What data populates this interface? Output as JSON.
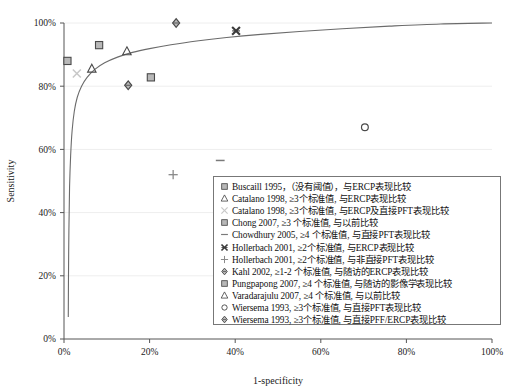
{
  "chart_data": {
    "type": "scatter",
    "title": "",
    "xlabel": "1-specificity",
    "ylabel": "Sensitivity",
    "xlim": [
      0,
      100
    ],
    "ylim": [
      0,
      100
    ],
    "xticks": [
      "0%",
      "20%",
      "40%",
      "60%",
      "80%",
      "100%"
    ],
    "xtick_values": [
      0,
      20,
      40,
      60,
      80,
      100
    ],
    "yticks": [
      "0%",
      "20%",
      "40%",
      "60%",
      "80%",
      "100%"
    ],
    "ytick_values": [
      0,
      20,
      40,
      60,
      80,
      100
    ],
    "grid": false,
    "legend_position": "inside-bottom-right",
    "points": [
      {
        "label": "Buscaill 1995",
        "marker": "square",
        "x": 0.8,
        "y": 88.0
      },
      {
        "label": "Catalano 1998 (x)",
        "marker": "x-light",
        "x": 3.0,
        "y": 84.0
      },
      {
        "label": "Catalano 1998 (triangle)",
        "marker": "triangle",
        "x": 6.5,
        "y": 85.5
      },
      {
        "label": "Chong 2007",
        "marker": "square",
        "x": 8.2,
        "y": 93.0
      },
      {
        "label": "Varadarajulu 2007",
        "marker": "triangle",
        "x": 14.7,
        "y": 91.0
      },
      {
        "label": "Kahl 2002",
        "marker": "diamond",
        "x": 15.0,
        "y": 80.3
      },
      {
        "label": "Pungpapong 2007",
        "marker": "square",
        "x": 20.3,
        "y": 82.8
      },
      {
        "label": "Wiersema 1993 (PFF/ERCP)",
        "marker": "diamond",
        "x": 26.2,
        "y": 100.0
      },
      {
        "label": "Hollerbach 2001 (ERCP)",
        "marker": "x-bold",
        "x": 40.2,
        "y": 97.5
      },
      {
        "label": "Wiersema 1993 (PFT)",
        "marker": "circle",
        "x": 70.3,
        "y": 67.0
      },
      {
        "label": "Chowdhury 2005",
        "marker": "dash",
        "x": 36.5,
        "y": 56.5
      },
      {
        "label": "Hollerbach 2001 (non-direct PFT)",
        "marker": "plus",
        "x": 25.5,
        "y": 52.0
      }
    ],
    "roc_curve": {
      "description": "summary ROC curve",
      "points": [
        [
          1.0,
          7.0
        ],
        [
          1.05,
          20.0
        ],
        [
          1.15,
          35.0
        ],
        [
          1.3,
          48.0
        ],
        [
          1.55,
          58.0
        ],
        [
          1.9,
          66.0
        ],
        [
          2.4,
          72.0
        ],
        [
          3.1,
          76.5
        ],
        [
          4.1,
          80.0
        ],
        [
          5.4,
          82.8
        ],
        [
          7.2,
          85.3
        ],
        [
          9.5,
          87.4
        ],
        [
          12.5,
          89.2
        ],
        [
          16.0,
          90.7
        ],
        [
          20.0,
          91.9
        ],
        [
          25.0,
          93.1
        ],
        [
          31.0,
          94.3
        ],
        [
          38.0,
          95.4
        ],
        [
          46.0,
          96.4
        ],
        [
          55.0,
          97.3
        ],
        [
          65.0,
          98.2
        ],
        [
          76.0,
          99.0
        ],
        [
          88.0,
          99.7
        ],
        [
          100.0,
          100.0
        ]
      ]
    }
  },
  "legend": {
    "items": [
      {
        "marker": "square",
        "text": "Buscaill 1995，（没有阈值），与ERCP表现比较"
      },
      {
        "marker": "triangle",
        "text": "Catalano 1998, ≥3个标准值, 与ERCP表现比较"
      },
      {
        "marker": "x-light",
        "text": "Catalano 1998, ≥3个标准值, 与ERCP及直接PFT表现比较"
      },
      {
        "marker": "square",
        "text": "Chong 2007, ≥3 个标准值, 与以前比较"
      },
      {
        "marker": "dash",
        "text": "Chowdhury 2005, ≥4 个标准值, 与直接PFT表现比较"
      },
      {
        "marker": "x-bold",
        "text": "Hollerbach 2001, ≥2个标准值, 与ERCP表现比较"
      },
      {
        "marker": "plus",
        "text": "Hollerbach 2001, ≥2个标准值, 与非直接PFT表现比较"
      },
      {
        "marker": "diamond",
        "text": "Kahl 2002, ≥1-2 个标准值, 与随访的ERCP表现比较"
      },
      {
        "marker": "square",
        "text": "Pungpapong 2007, ≥4 个标准值, 与随访的影像学表现比较"
      },
      {
        "marker": "triangle",
        "text": "Varadarajulu 2007, ≥4 个标准值, 与以前比较"
      },
      {
        "marker": "circle",
        "text": "Wiersema 1993, ≥3个标准值, 与直接PFT表现比较"
      },
      {
        "marker": "diamond",
        "text": "Wiersema 1993, ≥3个标准值, 与直接PFF/ERCP表现比较"
      }
    ]
  },
  "colors": {
    "marker_fill": "#b8b8b8",
    "marker_stroke": "#4a4a4a",
    "curve": "#6b6b6b",
    "axis": "#555555",
    "light_marker": "#c8c8c8",
    "text": "#111111",
    "background": "#ffffff"
  }
}
